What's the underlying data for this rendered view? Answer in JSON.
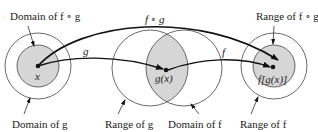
{
  "diagram": {
    "labels": {
      "domain_fog": "Domain of f ∘ g",
      "range_fog": "Range of f ∘ g",
      "domain_g": "Domain of g",
      "range_g": "Range of g",
      "domain_f": "Domain of f",
      "range_f": "Range of f"
    },
    "arrows": {
      "fog": "f ∘ g",
      "g": "g",
      "f": "f"
    },
    "points": {
      "x": "x",
      "gx": "g(x)",
      "fgx": "f[g(x)]"
    },
    "colors": {
      "shade": "#d6d6d6",
      "stroke": "#333333",
      "arrow": "#111111"
    }
  }
}
